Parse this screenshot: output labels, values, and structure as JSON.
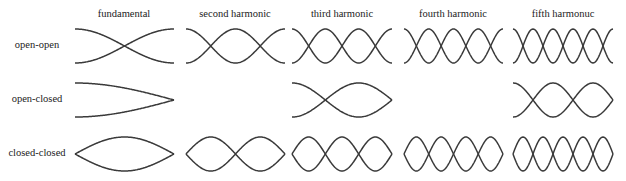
{
  "columns": [
    {
      "label": "fundamental",
      "n": 1,
      "x0": 75,
      "x1": 174
    },
    {
      "label": "second harmonic",
      "n": 2,
      "x0": 186,
      "x1": 285
    },
    {
      "label": "third harmonic",
      "n": 3,
      "x0": 292,
      "x1": 392
    },
    {
      "label": "fourth harmonic",
      "n": 4,
      "x0": 404,
      "x1": 503
    },
    {
      "label": "fifth harmonuc",
      "n": 5,
      "x0": 513,
      "x1": 613
    }
  ],
  "rows": [
    {
      "label": "open-open",
      "type": "open-open",
      "cy": 46,
      "amp": 17,
      "harmonics": [
        1,
        2,
        3,
        4,
        5
      ]
    },
    {
      "label": "open-closed",
      "type": "open-closed",
      "cy": 100,
      "amp": 17,
      "harmonics": [
        1,
        3,
        5
      ]
    },
    {
      "label": "closed-closed",
      "type": "closed-closed",
      "cy": 154,
      "amp": 17,
      "harmonics": [
        1,
        2,
        3,
        4,
        5
      ]
    }
  ],
  "colors": {
    "stroke": "#3a3a3a",
    "background": "#ffffff",
    "text": "#222222"
  }
}
